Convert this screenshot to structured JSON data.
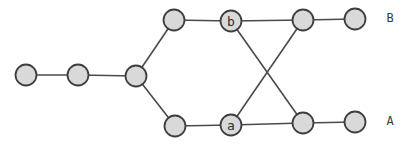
{
  "diagram": {
    "type": "graph",
    "background_color": "#ffffff",
    "node_fill_color": "#d9d9d9",
    "node_stroke_color": "#3e3e3e",
    "edge_color": "#4a4a4a",
    "node_label_color": "#2f2f2f",
    "endpoint_label_color": "#3a3a3a",
    "node_radius": 10.5,
    "edge_width": 1.6,
    "node_stroke_width": 1.8,
    "nodes": [
      {
        "id": "left-1",
        "x": 26,
        "y": 75,
        "label": ""
      },
      {
        "id": "left-2",
        "x": 78,
        "y": 75,
        "label": ""
      },
      {
        "id": "junction",
        "x": 136,
        "y": 76,
        "label": ""
      },
      {
        "id": "top-1",
        "x": 174,
        "y": 20,
        "label": ""
      },
      {
        "id": "node-b",
        "x": 231,
        "y": 21,
        "label": "b"
      },
      {
        "id": "top-3",
        "x": 303,
        "y": 20,
        "label": ""
      },
      {
        "id": "top-4",
        "x": 355,
        "y": 19,
        "label": ""
      },
      {
        "id": "bottom-1",
        "x": 175,
        "y": 126,
        "label": ""
      },
      {
        "id": "node-a",
        "x": 231,
        "y": 125,
        "label": "a"
      },
      {
        "id": "bottom-3",
        "x": 303,
        "y": 123,
        "label": ""
      },
      {
        "id": "bottom-4",
        "x": 355,
        "y": 122,
        "label": ""
      }
    ],
    "edges": [
      [
        "left-1",
        "left-2"
      ],
      [
        "left-2",
        "junction"
      ],
      [
        "junction",
        "top-1"
      ],
      [
        "junction",
        "bottom-1"
      ],
      [
        "top-1",
        "node-b"
      ],
      [
        "node-b",
        "top-3"
      ],
      [
        "top-3",
        "top-4"
      ],
      [
        "bottom-1",
        "node-a"
      ],
      [
        "node-a",
        "bottom-3"
      ],
      [
        "bottom-3",
        "bottom-4"
      ],
      [
        "node-b",
        "bottom-3"
      ],
      [
        "node-a",
        "top-3"
      ]
    ],
    "annotations": [
      {
        "text": "B",
        "x": 390,
        "y": 18
      },
      {
        "text": "A",
        "x": 390,
        "y": 121
      }
    ]
  }
}
